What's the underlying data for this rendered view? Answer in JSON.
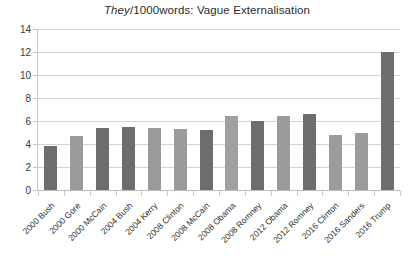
{
  "chart_data": {
    "type": "bar",
    "title": "They/1000words: Vague Externalisation",
    "title_italic_part": "They",
    "title_rest": "/1000words: Vague Externalisation",
    "xlabel": "",
    "ylabel": "",
    "ylim": [
      0,
      14
    ],
    "ytick_step": 2,
    "ytick_labels": [
      "0",
      "2",
      "4",
      "6",
      "8",
      "10",
      "12",
      "14"
    ],
    "grid": true,
    "legend": "none",
    "categories": [
      "2000 Bush",
      "2000 Gore",
      "2000 McCain",
      "2004 Bush",
      "2004 Kerry",
      "2008 Clinton",
      "2008 McCain",
      "2008 Obama",
      "2008 Romney",
      "2012 Obama",
      "2012 Romney",
      "2016 Clinton",
      "2016 Sanders",
      "2016 Trump"
    ],
    "values": [
      3.8,
      4.7,
      5.4,
      5.5,
      5.4,
      5.3,
      5.2,
      6.4,
      6.0,
      6.4,
      6.6,
      4.8,
      5.0,
      12.0
    ],
    "bar_colors": [
      "#6d6d6d",
      "#9b9b9b",
      "#6d6d6d",
      "#6d6d6d",
      "#9b9b9b",
      "#9b9b9b",
      "#6d6d6d",
      "#a0a0a0",
      "#6d6d6d",
      "#9b9b9b",
      "#6d6d6d",
      "#9b9b9b",
      "#9b9b9b",
      "#6d6d6d"
    ],
    "colors": {
      "dark_bar": "#6d6d6d",
      "light_bar": "#9b9b9b",
      "gridline": "#d4d4d4",
      "axis": "#c8c8c8",
      "text": "#2f2f2f",
      "background": "#ffffff"
    }
  }
}
